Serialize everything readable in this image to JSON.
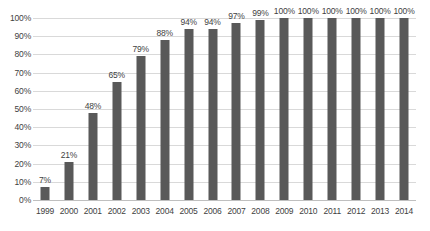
{
  "chart_data": {
    "type": "bar",
    "title": "",
    "subtitle": "",
    "xlabel": "",
    "ylabel": "",
    "categories": [
      "1999",
      "2000",
      "2001",
      "2002",
      "2003",
      "2004",
      "2005",
      "2006",
      "2007",
      "2008",
      "2009",
      "2010",
      "2011",
      "2012",
      "2013",
      "2014"
    ],
    "values": [
      7,
      21,
      48,
      65,
      79,
      88,
      94,
      94,
      97,
      99,
      100,
      100,
      100,
      100,
      100,
      100
    ],
    "data_labels": [
      "7%",
      "21%",
      "48%",
      "65%",
      "79%",
      "88%",
      "94%",
      "94%",
      "97%",
      "99%",
      "100%",
      "100%",
      "100%",
      "100%",
      "100%",
      "100%"
    ],
    "ylim": [
      0,
      100
    ],
    "ytick_values": [
      0,
      10,
      20,
      30,
      40,
      50,
      60,
      70,
      80,
      90,
      100
    ],
    "ytick_labels": [
      "0%",
      "10%",
      "20%",
      "30%",
      "40%",
      "50%",
      "60%",
      "70%",
      "80%",
      "90%",
      "100%"
    ],
    "grid": "horizontal",
    "legend": "none",
    "series_name": "",
    "colors": {
      "bar_fill": "#595959",
      "gridline": "#d9d9d9",
      "baseline": "#bfbfbf",
      "label_text": "#3f3f3f",
      "background": "#ffffff"
    }
  }
}
